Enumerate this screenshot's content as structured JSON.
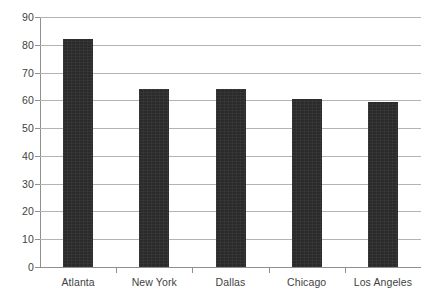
{
  "chart_data": {
    "type": "bar",
    "title": "",
    "subtitle": "",
    "xlabel": "",
    "ylabel": "",
    "categories": [
      "Atlanta",
      "New York",
      "Dallas",
      "Chicago",
      "Los Angeles"
    ],
    "values": [
      82,
      64,
      64,
      60.5,
      59.5
    ],
    "series": [
      {
        "name": "",
        "values": [
          82,
          64,
          64,
          60.5,
          59.5
        ]
      }
    ],
    "ylim": [
      0,
      90
    ],
    "ytick_step": 10,
    "ytick_labels": [
      "0",
      "10",
      "20",
      "30",
      "40",
      "50",
      "60",
      "70",
      "80",
      "90"
    ],
    "xtick_labels": [
      "Atlanta",
      "New York",
      "Dallas",
      "Chicago",
      "Los Angeles"
    ],
    "grid": true,
    "grid_axis": "y",
    "legend": false,
    "legend_position": "none",
    "annotations": [],
    "colors": {
      "bar_fill": "#2b2b2b",
      "gridline": "#b3b3b3",
      "axis_line": "#8f8f8f",
      "background": "#ffffff",
      "tick_label": "#3f3f3f"
    }
  }
}
